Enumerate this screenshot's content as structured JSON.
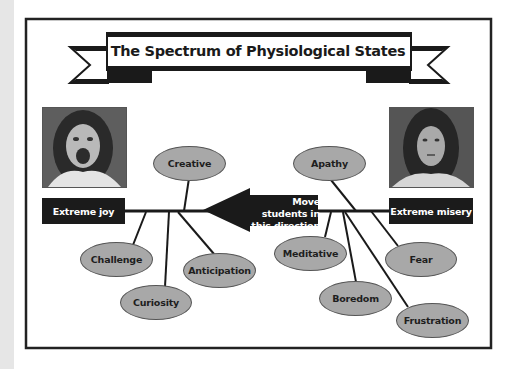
{
  "title": "The Spectrum of Physiological States",
  "left_end": {
    "label": "Extreme joy",
    "photo": "excited-face-photo"
  },
  "right_end": {
    "label": "Extreme misery",
    "photo": "sad-face-photo"
  },
  "arrow": {
    "line1": "Move students in",
    "line2": "this direction",
    "direction": "left"
  },
  "positive_states": [
    "Creative",
    "Challenge",
    "Curiosity",
    "Anticipation"
  ],
  "negative_states": [
    "Apathy",
    "Meditative",
    "Fear",
    "Boredom",
    "Frustration"
  ],
  "colors": {
    "frame": "#222222",
    "node_fill": "#a8a8a8",
    "label_fill": "#1b1b1b",
    "side_strip": "#e6e6e6"
  }
}
